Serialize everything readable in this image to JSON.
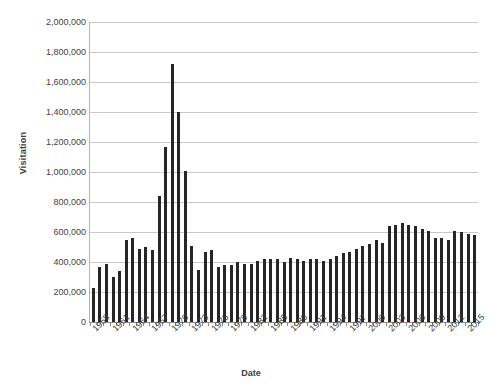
{
  "chart_data": {
    "type": "bar",
    "title": "",
    "xlabel": "Date",
    "ylabel": "Visitation",
    "ylim": [
      0,
      2000000
    ],
    "ytick_labels": [
      "2,000,000",
      "1,800,000",
      "1,600,000",
      "1,400,000",
      "1,200,000",
      "1,000,000",
      "800,000",
      "600,000",
      "400,000",
      "200,000",
      "0"
    ],
    "ytick_values": [
      2000000,
      1800000,
      1600000,
      1400000,
      1200000,
      1000000,
      800000,
      600000,
      400000,
      200000,
      0
    ],
    "grid": true,
    "legend": "none",
    "xtick_label_interval": 3,
    "xtick_labels": [
      "1958",
      "1961",
      "1964",
      "1967",
      "1970",
      "1973",
      "1976",
      "1979",
      "1982",
      "1985",
      "1988",
      "1991",
      "1994",
      "1997",
      "2000",
      "2003",
      "2006",
      "2009",
      "2012",
      "2015"
    ],
    "bar_color": "#262626",
    "gridline_color": "#c9c9c9",
    "axis_color": "#8c8c8c",
    "categories": [
      "1958",
      "1959",
      "1960",
      "1961",
      "1962",
      "1963",
      "1964",
      "1965",
      "1966",
      "1967",
      "1968",
      "1969",
      "1970",
      "1971",
      "1972",
      "1973",
      "1974",
      "1975",
      "1976",
      "1977",
      "1978",
      "1979",
      "1980",
      "1981",
      "1982",
      "1983",
      "1984",
      "1985",
      "1986",
      "1987",
      "1988",
      "1989",
      "1990",
      "1991",
      "1992",
      "1993",
      "1994",
      "1995",
      "1996",
      "1997",
      "1998",
      "1999",
      "2000",
      "2001",
      "2002",
      "2003",
      "2004",
      "2005",
      "2006",
      "2007",
      "2008",
      "2009",
      "2010",
      "2011",
      "2012",
      "2013",
      "2014",
      "2015",
      "2016"
    ],
    "values": [
      230000,
      370000,
      390000,
      300000,
      340000,
      550000,
      560000,
      490000,
      500000,
      480000,
      840000,
      1170000,
      1720000,
      1400000,
      1010000,
      510000,
      350000,
      470000,
      480000,
      370000,
      380000,
      380000,
      400000,
      390000,
      390000,
      410000,
      420000,
      420000,
      420000,
      400000,
      430000,
      420000,
      410000,
      420000,
      420000,
      410000,
      420000,
      440000,
      460000,
      470000,
      490000,
      510000,
      520000,
      550000,
      530000,
      640000,
      650000,
      660000,
      650000,
      640000,
      620000,
      610000,
      560000,
      560000,
      550000,
      610000,
      600000,
      590000,
      580000
    ]
  }
}
